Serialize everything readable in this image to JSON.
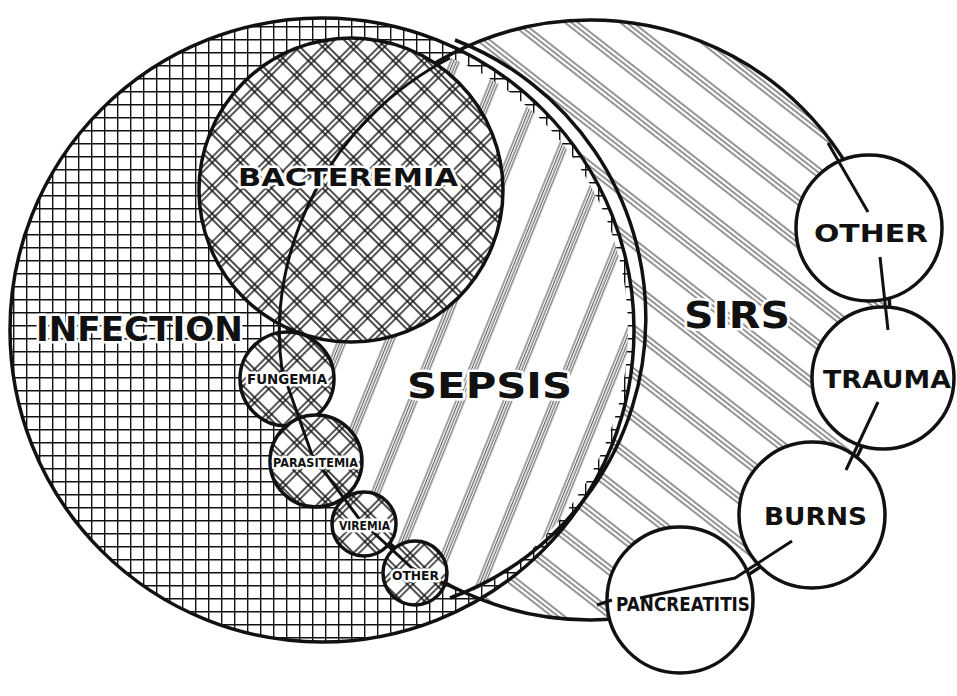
{
  "diagram": {
    "type": "venn",
    "colors": {
      "ink": "#111111",
      "background": "#ffffff"
    },
    "regions": [
      {
        "id": "infection",
        "label": "INFECTION",
        "pattern": "square-grid"
      },
      {
        "id": "sirs",
        "label": "SIRS",
        "pattern": "diagonal-triple-lines-down"
      },
      {
        "id": "sepsis",
        "label": "SEPSIS",
        "pattern": "diagonal-quad-lines-up",
        "note": "intersection of INFECTION and SIRS"
      }
    ],
    "infection_subsets": [
      {
        "id": "bacteremia",
        "label": "BACTEREMIA"
      },
      {
        "id": "fungemia",
        "label": "FUNGEMIA"
      },
      {
        "id": "parasitemia",
        "label": "PARASITEMIA"
      },
      {
        "id": "viremia",
        "label": "VIREMIA"
      },
      {
        "id": "infection-other",
        "label": "OTHER"
      }
    ],
    "sirs_causes": [
      {
        "id": "sirs-other",
        "label": "OTHER"
      },
      {
        "id": "trauma",
        "label": "TRAUMA"
      },
      {
        "id": "burns",
        "label": "BURNS"
      },
      {
        "id": "pancreatitis",
        "label": "PANCREATITIS"
      }
    ]
  }
}
